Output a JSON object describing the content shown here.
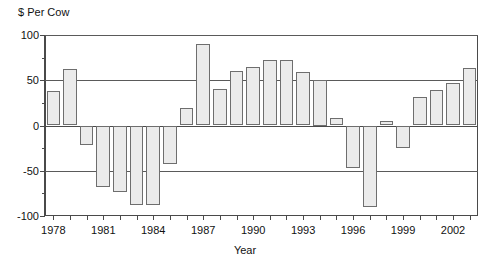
{
  "chart_data": {
    "type": "bar",
    "title": "",
    "ylabel": "$ Per Cow",
    "xlabel": "Year",
    "ylim": [
      -100,
      100
    ],
    "yticks": [
      -100,
      -50,
      0,
      50,
      100
    ],
    "ytick_labels": [
      "-100",
      "-50",
      "0",
      "50",
      "100"
    ],
    "gridlines": [
      -50,
      50,
      100
    ],
    "grid": true,
    "legend": "none",
    "xtick_labels": [
      "1978",
      "1981",
      "1984",
      "1987",
      "1990",
      "1993",
      "1996",
      "1999",
      "2002"
    ],
    "categories": [
      "1978",
      "1979",
      "1980",
      "1981",
      "1982",
      "1983",
      "1984",
      "1985",
      "1986",
      "1987",
      "1988",
      "1989",
      "1990",
      "1991",
      "1992",
      "1993",
      "1994",
      "1995",
      "1996",
      "1997",
      "1998",
      "1999",
      "2000",
      "2001",
      "2002",
      "2003"
    ],
    "values": [
      38,
      62,
      -21,
      -68,
      -74,
      -88,
      -88,
      -43,
      19,
      90,
      40,
      60,
      65,
      72,
      72,
      59,
      50,
      8,
      -47,
      -90,
      5,
      -25,
      31,
      39,
      47,
      64
    ],
    "bar_color": "#ebebeb",
    "bar_edge_color": "#6e6e6e",
    "axis_color": "#4a4a4a"
  },
  "final_value": 86
}
